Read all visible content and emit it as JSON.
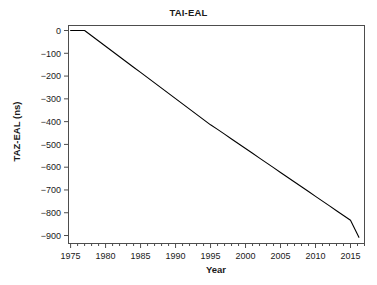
{
  "chart_data": {
    "type": "line",
    "title": "TAI-EAL",
    "xlabel": "Year",
    "ylabel": "TAZ-EAL (ns)",
    "xlim": [
      1974.7,
      2017.0
    ],
    "ylim": [
      -935,
      22
    ],
    "grid": false,
    "legend": null,
    "xticks": [
      1975,
      1980,
      1985,
      1990,
      1995,
      2000,
      2005,
      2010,
      2015
    ],
    "xtick_labels": [
      "1975",
      "1980",
      "1985",
      "1990",
      "1995",
      "2000",
      "2005",
      "2010",
      "2015"
    ],
    "xminor_tick_step": 1,
    "yticks": [
      0,
      -100,
      -200,
      -300,
      -400,
      -500,
      -600,
      -700,
      -800,
      -900
    ],
    "ytick_labels": [
      "0",
      "−100",
      "−200",
      "−300",
      "−400",
      "−500",
      "−600",
      "−700",
      "−800",
      "−900"
    ],
    "line_color": "#000000",
    "line_width": 1.1,
    "series": [
      {
        "name": "TAI-EAL",
        "x": [
          1975.0,
          1976.0,
          1977.0,
          1978.0,
          1979.0,
          1980.0,
          1981.0,
          1982.0,
          1983.0,
          1984.0,
          1985.0,
          1986.0,
          1987.0,
          1988.0,
          1989.0,
          1990.0,
          1991.0,
          1992.0,
          1993.0,
          1994.0,
          1995.0,
          1996.0,
          1997.0,
          1998.0,
          1999.0,
          2000.0,
          2001.0,
          2002.0,
          2003.0,
          2004.0,
          2005.0,
          2006.0,
          2007.0,
          2008.0,
          2009.0,
          2010.0,
          2011.0,
          2012.0,
          2013.0,
          2014.0,
          2015.0,
          2016.2
        ],
        "y": [
          0,
          0,
          0,
          -23,
          -46,
          -69,
          -92,
          -115,
          -138,
          -161,
          -184,
          -207,
          -230,
          -253,
          -276,
          -299,
          -322,
          -345,
          -368,
          -391,
          -414,
          -434,
          -455,
          -476,
          -497,
          -518,
          -539,
          -560,
          -581,
          -602,
          -623,
          -644,
          -665,
          -686,
          -707,
          -728,
          -749,
          -770,
          -791,
          -812,
          -833,
          -908
        ]
      }
    ]
  }
}
